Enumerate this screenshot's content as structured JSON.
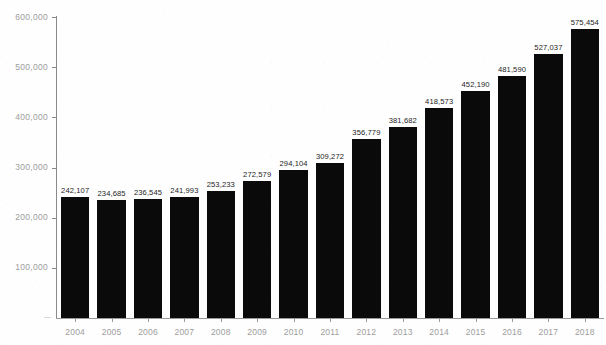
{
  "chart_data": {
    "type": "bar",
    "title": "",
    "subtitle": "",
    "xlabel": "",
    "ylabel": "",
    "categories": [
      "2004",
      "2005",
      "2006",
      "2007",
      "2008",
      "2009",
      "2010",
      "2011",
      "2012",
      "2013",
      "2014",
      "2015",
      "2016",
      "2017",
      "2018"
    ],
    "values": [
      242107,
      234685,
      236545,
      241993,
      253233,
      272579,
      294104,
      309272,
      356779,
      381682,
      418573,
      452190,
      481590,
      527037,
      575454
    ],
    "value_labels": [
      "242,107",
      "234,685",
      "236,545",
      "241,993",
      "253,233",
      "272,579",
      "294,104",
      "309,272",
      "356,779",
      "381,682",
      "418,573",
      "452,190",
      "481,590",
      "527,037",
      "575,454"
    ],
    "ylim": [
      0,
      600000
    ],
    "y_ticks": [
      100000,
      200000,
      300000,
      400000,
      500000,
      600000
    ],
    "y_tick_labels": [
      "100,000",
      "200,000",
      "300,000",
      "400,000",
      "500,000",
      "600,000"
    ],
    "grid": false,
    "legend": null,
    "legend_position": "none",
    "bar_color": "#0a0a0a",
    "axis_color": "#8a8a8a",
    "tick_label_color": "#9d9d9d",
    "data_label_color": "#242424",
    "background_color": "#fefefe",
    "data_labels_visible": true
  }
}
